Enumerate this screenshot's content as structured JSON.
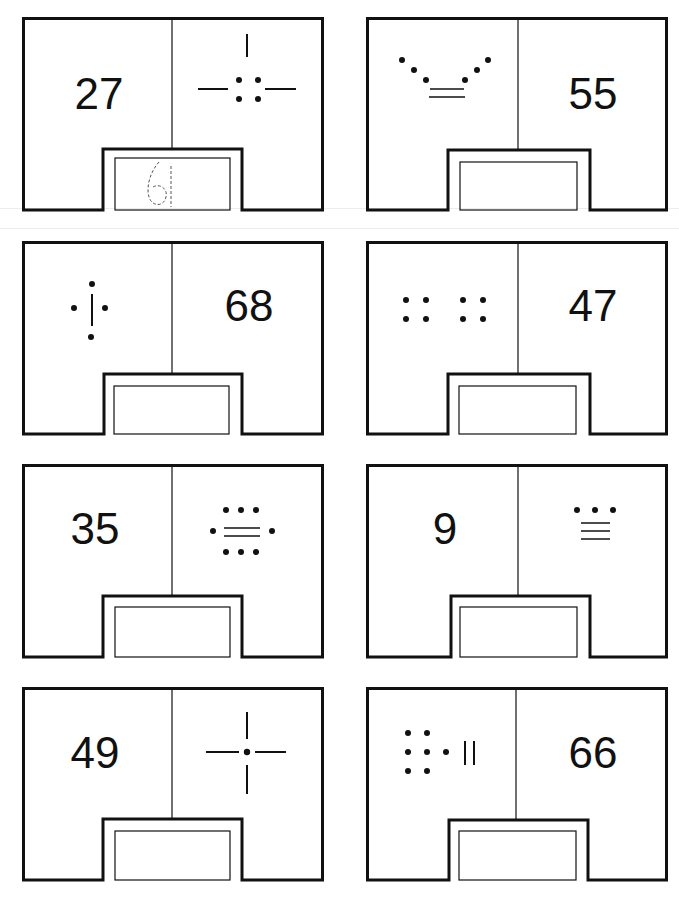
{
  "worksheet": {
    "title_visible": false,
    "instructions": "",
    "cards": [
      {
        "id": 1,
        "left": {
          "type": "number",
          "value": "27"
        },
        "right": {
          "type": "mayan",
          "symbol": "bar-dots-27"
        },
        "answer": "61",
        "answer_style": "dashed-trace"
      },
      {
        "id": 2,
        "left": {
          "type": "mayan",
          "symbol": "dots-bars-55"
        },
        "right": {
          "type": "number",
          "value": "55"
        },
        "answer": ""
      },
      {
        "id": 3,
        "left": {
          "type": "mayan",
          "symbol": "dots-bar-68"
        },
        "right": {
          "type": "number",
          "value": "68"
        },
        "answer": ""
      },
      {
        "id": 4,
        "left": {
          "type": "mayan",
          "symbol": "dots-47"
        },
        "right": {
          "type": "number",
          "value": "47"
        },
        "answer": ""
      },
      {
        "id": 5,
        "left": {
          "type": "number",
          "value": "35"
        },
        "right": {
          "type": "mayan",
          "symbol": "dots-bars-35"
        },
        "answer": ""
      },
      {
        "id": 6,
        "left": {
          "type": "number",
          "value": "9"
        },
        "right": {
          "type": "mayan",
          "symbol": "dots-bars-9"
        },
        "answer": ""
      },
      {
        "id": 7,
        "left": {
          "type": "number",
          "value": "49"
        },
        "right": {
          "type": "mayan",
          "symbol": "cross-dot-49"
        },
        "answer": ""
      },
      {
        "id": 8,
        "left": {
          "type": "mayan",
          "symbol": "dots-bars-66"
        },
        "right": {
          "type": "number",
          "value": "66"
        },
        "answer": ""
      }
    ]
  },
  "colors": {
    "ink": "#111111",
    "paper": "#ffffff"
  }
}
